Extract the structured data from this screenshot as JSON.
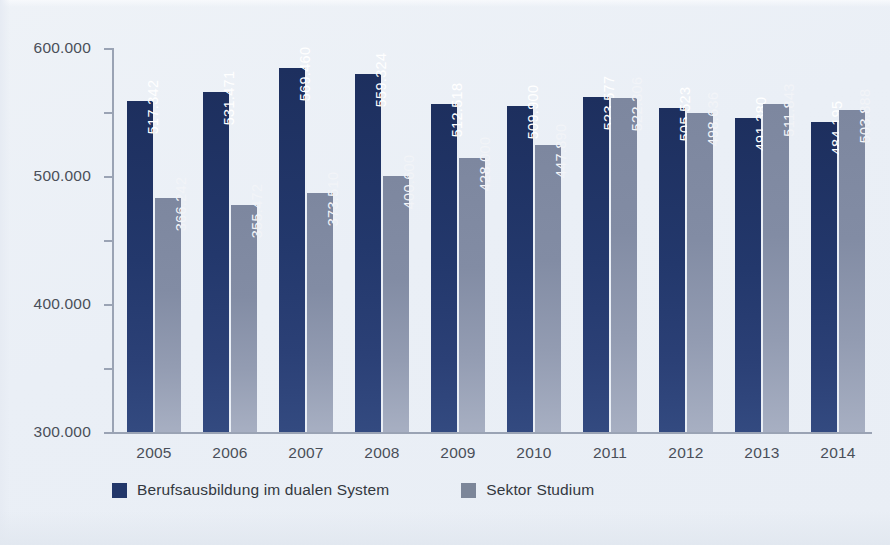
{
  "chart_data": {
    "type": "bar",
    "title": "",
    "subtitle": "",
    "xlabel": "",
    "ylabel": "",
    "categories": [
      "2005",
      "2006",
      "2007",
      "2008",
      "2009",
      "2010",
      "2011",
      "2012",
      "2013",
      "2014"
    ],
    "series": [
      {
        "name": "Berufsausbildung im dualen System",
        "color": "#22376a",
        "values": [
          517342,
          531471,
          569460,
          559324,
          512518,
          509900,
          523577,
          505523,
          491380,
          484195
        ],
        "labels": [
          "517.342",
          "531.471",
          "569.460",
          "559.324",
          "512.518",
          "509.900",
          "523.577",
          "505.523",
          "491.380",
          "484.195"
        ]
      },
      {
        "name": "Sektor Studium",
        "color": "#8a93a9",
        "values": [
          366242,
          355472,
          373510,
          400600,
          428000,
          447890,
          522306,
          498636,
          511843,
          503888
        ],
        "labels": [
          "366.242",
          "355.472",
          "373.510",
          "400.600",
          "428.000",
          "447.890",
          "522.306",
          "498.636",
          "511.843",
          "503.888"
        ]
      }
    ],
    "ylim": [
      0,
      600000
    ],
    "y_ticks": [
      0,
      100000,
      200000,
      300000,
      400000,
      500000,
      600000
    ],
    "y_tick_labels": [
      "0",
      "100.000",
      "200.000",
      "300.000",
      "400.000",
      "500.000",
      "600.000"
    ],
    "grid": false,
    "legend_position": "bottom-left",
    "number_format": "german-dot-thousands"
  },
  "legend": {
    "items": [
      {
        "label": "Berufsausbildung im dualen System",
        "color": "#22376a"
      },
      {
        "label": "Sektor Studium",
        "color": "#7c8699"
      }
    ]
  },
  "colors": {
    "background": "#eef2f7",
    "axis": "#9aa3b4",
    "tick_text": "#4a4f59",
    "primary_bar": "#22376a",
    "secondary_bar": "#8a93a9",
    "value_text": "#ffffff"
  }
}
